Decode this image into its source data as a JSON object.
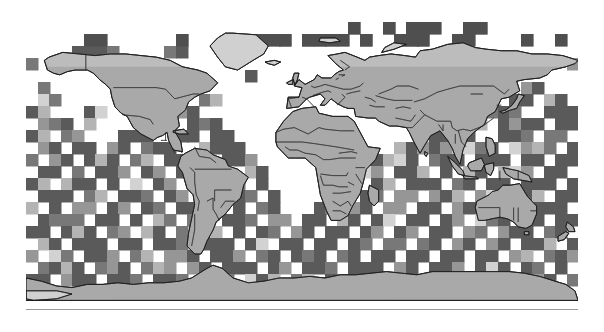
{
  "figure": {
    "type": "gridded-world-map",
    "background_color": "#ffffff",
    "title": "",
    "caption": ""
  },
  "map": {
    "projection": "equirectangular",
    "lon_range": [
      -180,
      180
    ],
    "lat_range": [
      -90,
      90
    ],
    "ocean_color": "#ffffff",
    "land_color": "#a9a9a9",
    "ice_color": "#d0d0d0",
    "coastline_color": "#1a1a1a",
    "border_color": "#2b2b2b",
    "frame_color": "#9a9a9a",
    "plot_left_px": 26,
    "plot_top_px": 22,
    "plot_width_px": 552,
    "plot_height_px": 288
  },
  "legend": {
    "visible": false,
    "entries": []
  },
  "axes": {
    "x_tick_labels": [],
    "y_tick_labels": [],
    "grid_visible": false
  },
  "chart_data": {
    "type": "heatmap",
    "title": "",
    "xlabel": "",
    "ylabel": "",
    "x": "longitude",
    "y": "latitude",
    "xlim": [
      -180,
      180
    ],
    "ylim": [
      -90,
      90
    ],
    "cell_size_deg": 7.5,
    "grid_cols": 48,
    "grid_rows": 24,
    "colormap": "grayscale",
    "nodata_value": null,
    "nodata_color": "#ffffff",
    "value_colors": {
      "1": "#5a5a5a",
      "2": "#787878",
      "3": "#969696",
      "4": "#b4b4b4",
      "5": "#d2d2d2"
    },
    "legend_position": "none",
    "grid": "off",
    "note": "Each cell encodes an ordinal grayscale level; blank (white) cells are no-data.",
    "values": [
      [
        0,
        0,
        0,
        0,
        0,
        0,
        0,
        0,
        0,
        0,
        0,
        0,
        0,
        0,
        0,
        0,
        0,
        0,
        0,
        0,
        0,
        0,
        0,
        0,
        0,
        0,
        0,
        0,
        1,
        0,
        0,
        1,
        0,
        1,
        1,
        1,
        0,
        0,
        1,
        1,
        0,
        0,
        0,
        0,
        0,
        0,
        0,
        0
      ],
      [
        0,
        0,
        0,
        0,
        0,
        1,
        1,
        0,
        0,
        0,
        0,
        0,
        0,
        1,
        0,
        0,
        0,
        0,
        0,
        0,
        1,
        1,
        1,
        0,
        1,
        1,
        1,
        1,
        0,
        1,
        0,
        0,
        1,
        1,
        1,
        0,
        0,
        1,
        1,
        0,
        0,
        0,
        0,
        1,
        0,
        0,
        1,
        0
      ],
      [
        0,
        0,
        0,
        0,
        1,
        1,
        1,
        1,
        0,
        0,
        0,
        0,
        1,
        1,
        0,
        0,
        0,
        0,
        0,
        0,
        0,
        0,
        0,
        0,
        0,
        0,
        0,
        0,
        0,
        0,
        0,
        0,
        0,
        0,
        0,
        0,
        0,
        0,
        0,
        0,
        0,
        0,
        0,
        0,
        0,
        0,
        0,
        0
      ],
      [
        1,
        0,
        0,
        0,
        0,
        0,
        0,
        0,
        0,
        0,
        0,
        0,
        0,
        0,
        0,
        0,
        0,
        0,
        0,
        0,
        0,
        0,
        0,
        0,
        0,
        0,
        0,
        0,
        0,
        0,
        0,
        0,
        0,
        0,
        0,
        0,
        0,
        0,
        0,
        0,
        0,
        0,
        0,
        0,
        0,
        0,
        0,
        1
      ],
      [
        0,
        0,
        0,
        0,
        0,
        0,
        0,
        0,
        0,
        0,
        0,
        0,
        0,
        0,
        0,
        0,
        0,
        0,
        0,
        1,
        0,
        0,
        0,
        0,
        0,
        0,
        0,
        0,
        0,
        0,
        0,
        0,
        0,
        0,
        0,
        0,
        0,
        0,
        0,
        0,
        0,
        0,
        0,
        0,
        0,
        0,
        0,
        0
      ],
      [
        0,
        1,
        0,
        0,
        0,
        0,
        0,
        0,
        0,
        0,
        0,
        1,
        1,
        0,
        1,
        0,
        0,
        0,
        0,
        0,
        0,
        0,
        0,
        0,
        0,
        0,
        0,
        0,
        0,
        0,
        0,
        0,
        0,
        0,
        0,
        0,
        0,
        0,
        1,
        1,
        0,
        0,
        0,
        1,
        1,
        0,
        0,
        0
      ],
      [
        0,
        1,
        1,
        0,
        0,
        0,
        0,
        0,
        0,
        0,
        0,
        1,
        1,
        0,
        0,
        1,
        1,
        0,
        0,
        0,
        0,
        0,
        0,
        0,
        0,
        0,
        0,
        0,
        0,
        0,
        0,
        0,
        0,
        0,
        0,
        0,
        0,
        0,
        1,
        1,
        1,
        0,
        1,
        1,
        0,
        1,
        1,
        0
      ],
      [
        1,
        1,
        0,
        0,
        0,
        1,
        1,
        0,
        0,
        0,
        0,
        0,
        1,
        1,
        1,
        0,
        0,
        0,
        0,
        0,
        0,
        0,
        0,
        0,
        0,
        0,
        0,
        0,
        0,
        0,
        0,
        0,
        0,
        0,
        0,
        0,
        0,
        1,
        1,
        0,
        1,
        1,
        1,
        0,
        0,
        1,
        1,
        1
      ],
      [
        0,
        1,
        1,
        1,
        0,
        1,
        0,
        0,
        0,
        0,
        1,
        1,
        0,
        0,
        1,
        1,
        1,
        0,
        0,
        0,
        0,
        0,
        0,
        0,
        0,
        0,
        0,
        0,
        0,
        0,
        0,
        0,
        0,
        0,
        0,
        0,
        1,
        1,
        1,
        1,
        0,
        1,
        1,
        1,
        1,
        0,
        1,
        1
      ],
      [
        1,
        1,
        0,
        1,
        1,
        0,
        0,
        0,
        1,
        1,
        1,
        0,
        0,
        1,
        1,
        0,
        1,
        1,
        0,
        0,
        0,
        0,
        0,
        0,
        0,
        0,
        0,
        0,
        0,
        0,
        0,
        0,
        0,
        0,
        0,
        1,
        1,
        1,
        1,
        0,
        0,
        1,
        1,
        1,
        0,
        1,
        1,
        0
      ],
      [
        0,
        1,
        1,
        0,
        1,
        1,
        0,
        1,
        1,
        0,
        1,
        1,
        1,
        0,
        0,
        1,
        1,
        1,
        1,
        0,
        0,
        0,
        0,
        0,
        0,
        0,
        0,
        0,
        0,
        0,
        0,
        0,
        1,
        1,
        1,
        1,
        1,
        0,
        1,
        1,
        1,
        0,
        1,
        1,
        1,
        1,
        0,
        1
      ],
      [
        1,
        0,
        1,
        1,
        0,
        1,
        1,
        1,
        0,
        1,
        1,
        0,
        1,
        1,
        0,
        1,
        0,
        1,
        1,
        1,
        0,
        0,
        0,
        0,
        0,
        0,
        0,
        0,
        0,
        1,
        1,
        1,
        1,
        1,
        0,
        1,
        1,
        1,
        0,
        1,
        1,
        1,
        0,
        1,
        1,
        0,
        1,
        1
      ],
      [
        0,
        1,
        1,
        0,
        1,
        0,
        1,
        1,
        1,
        0,
        1,
        1,
        0,
        1,
        1,
        0,
        1,
        1,
        0,
        1,
        1,
        0,
        0,
        0,
        0,
        0,
        0,
        0,
        1,
        1,
        1,
        0,
        1,
        1,
        1,
        0,
        1,
        0,
        1,
        1,
        0,
        1,
        1,
        1,
        0,
        1,
        1,
        0
      ],
      [
        1,
        1,
        0,
        1,
        1,
        1,
        0,
        1,
        0,
        1,
        0,
        1,
        1,
        0,
        1,
        1,
        0,
        1,
        1,
        0,
        1,
        0,
        0,
        0,
        0,
        0,
        0,
        1,
        1,
        0,
        1,
        1,
        0,
        1,
        1,
        1,
        0,
        1,
        1,
        0,
        1,
        1,
        0,
        1,
        1,
        1,
        0,
        1
      ],
      [
        0,
        1,
        1,
        1,
        0,
        1,
        1,
        0,
        1,
        1,
        1,
        0,
        1,
        1,
        0,
        1,
        1,
        0,
        1,
        1,
        0,
        1,
        0,
        0,
        0,
        0,
        1,
        1,
        0,
        1,
        1,
        0,
        1,
        1,
        0,
        1,
        1,
        1,
        0,
        1,
        1,
        0,
        1,
        1,
        1,
        0,
        1,
        1
      ],
      [
        1,
        0,
        1,
        0,
        1,
        1,
        0,
        1,
        1,
        0,
        1,
        1,
        0,
        1,
        1,
        0,
        1,
        0,
        1,
        0,
        1,
        1,
        0,
        0,
        0,
        1,
        1,
        0,
        1,
        1,
        0,
        1,
        1,
        0,
        1,
        1,
        0,
        1,
        1,
        1,
        0,
        1,
        1,
        0,
        1,
        1,
        1,
        0
      ],
      [
        0,
        1,
        1,
        1,
        1,
        0,
        1,
        1,
        0,
        1,
        0,
        1,
        1,
        0,
        1,
        1,
        0,
        1,
        1,
        1,
        0,
        1,
        1,
        0,
        1,
        1,
        0,
        1,
        1,
        0,
        1,
        1,
        0,
        1,
        1,
        0,
        1,
        1,
        0,
        1,
        1,
        1,
        0,
        1,
        1,
        0,
        1,
        1
      ],
      [
        1,
        1,
        0,
        1,
        1,
        1,
        0,
        1,
        1,
        0,
        1,
        1,
        0,
        1,
        0,
        1,
        1,
        0,
        1,
        0,
        1,
        1,
        0,
        1,
        1,
        0,
        1,
        1,
        0,
        1,
        1,
        0,
        1,
        1,
        0,
        1,
        1,
        0,
        1,
        1,
        0,
        1,
        1,
        1,
        0,
        1,
        1,
        0
      ],
      [
        0,
        1,
        1,
        0,
        1,
        1,
        1,
        0,
        1,
        1,
        0,
        1,
        1,
        1,
        0,
        1,
        1,
        1,
        0,
        1,
        1,
        0,
        1,
        1,
        0,
        1,
        1,
        0,
        1,
        1,
        0,
        1,
        1,
        0,
        1,
        1,
        0,
        1,
        1,
        0,
        1,
        1,
        0,
        1,
        1,
        1,
        0,
        1
      ],
      [
        1,
        0,
        1,
        1,
        0,
        1,
        1,
        1,
        0,
        1,
        1,
        0,
        1,
        1,
        1,
        0,
        1,
        1,
        1,
        0,
        1,
        1,
        0,
        1,
        1,
        1,
        0,
        1,
        1,
        0,
        1,
        1,
        0,
        1,
        1,
        0,
        1,
        1,
        0,
        1,
        1,
        0,
        1,
        1,
        0,
        1,
        1,
        1
      ],
      [
        0,
        1,
        1,
        1,
        1,
        0,
        1,
        1,
        1,
        0,
        1,
        1,
        1,
        0,
        1,
        1,
        0,
        1,
        1,
        1,
        0,
        1,
        1,
        0,
        1,
        1,
        1,
        0,
        1,
        1,
        1,
        0,
        1,
        1,
        0,
        1,
        1,
        1,
        0,
        1,
        1,
        1,
        0,
        1,
        1,
        0,
        1,
        0
      ],
      [
        1,
        1,
        0,
        1,
        1,
        1,
        0,
        1,
        1,
        1,
        0,
        1,
        1,
        1,
        0,
        1,
        1,
        1,
        0,
        1,
        1,
        1,
        0,
        1,
        1,
        0,
        1,
        1,
        1,
        0,
        1,
        1,
        1,
        0,
        1,
        1,
        0,
        1,
        1,
        1,
        0,
        1,
        1,
        0,
        1,
        1,
        0,
        1
      ],
      [
        0,
        0,
        0,
        0,
        0,
        0,
        0,
        0,
        0,
        0,
        0,
        0,
        0,
        0,
        0,
        0,
        0,
        0,
        0,
        0,
        0,
        0,
        0,
        0,
        0,
        0,
        0,
        0,
        0,
        0,
        0,
        0,
        0,
        0,
        0,
        0,
        0,
        0,
        0,
        0,
        0,
        0,
        0,
        0,
        0,
        0,
        0,
        0
      ],
      [
        0,
        0,
        0,
        0,
        0,
        0,
        0,
        0,
        0,
        0,
        0,
        0,
        0,
        0,
        0,
        0,
        0,
        0,
        0,
        0,
        0,
        0,
        0,
        0,
        0,
        0,
        0,
        0,
        0,
        0,
        0,
        0,
        0,
        0,
        0,
        0,
        0,
        0,
        0,
        0,
        0,
        0,
        0,
        0,
        0,
        0,
        0,
        0
      ]
    ]
  }
}
